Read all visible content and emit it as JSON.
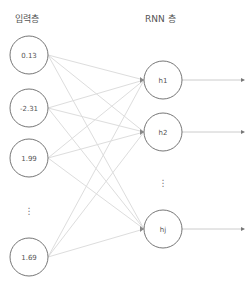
{
  "titles": {
    "input_layer": "입력층",
    "rnn_layer": "RNN 층"
  },
  "input_nodes": [
    {
      "label": "0.13",
      "cx": 29,
      "cy": 55
    },
    {
      "label": "-2.31",
      "cx": 29,
      "cy": 108
    },
    {
      "label": "1.99",
      "cx": 29,
      "cy": 158
    },
    {
      "label": "1.69",
      "cx": 29,
      "cy": 257
    }
  ],
  "input_ellipsis": {
    "label": "⋮",
    "x": 29,
    "y": 210
  },
  "hidden_nodes": [
    {
      "label": "h1",
      "cx": 163,
      "cy": 80
    },
    {
      "label": "h2",
      "cx": 163,
      "cy": 132
    },
    {
      "label": "hj",
      "cx": 163,
      "cy": 229
    }
  ],
  "hidden_ellipsis": {
    "label": "⋮",
    "x": 163,
    "y": 182
  },
  "style": {
    "node_radius": 19,
    "node_stroke": "#666666",
    "edge_color": "#dddddd",
    "arrow_color": "#cccccc",
    "arrowhead_color": "#777777",
    "output_arrow_end_x": 244
  }
}
